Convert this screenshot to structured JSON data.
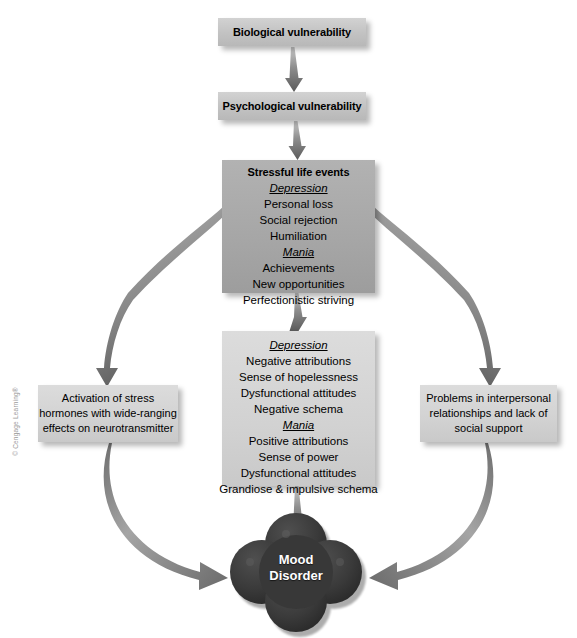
{
  "figure": {
    "background": "#ffffff",
    "copyright": "© Cengage Learning®"
  },
  "colors": {
    "box_top_fill": "#c5c5c5",
    "box_stressful_fill": "#a8a8a8",
    "box_cognitive_fill": "#d2d2d2",
    "box_side_fill": "#cfcfcf",
    "cloud_fill": "#3a3a3a",
    "arrow_fill": "#707070",
    "text": "#000000",
    "cloud_text": "#ffffff"
  },
  "nodes": {
    "biological": {
      "title": "Biological vulnerability"
    },
    "psychological": {
      "title": "Psychological vulnerability"
    },
    "stressful": {
      "title": "Stressful life events",
      "depression_label": "Depression",
      "depression_items": [
        "Personal loss",
        "Social rejection",
        "Humiliation"
      ],
      "mania_label": "Mania",
      "mania_items": [
        "Achievements",
        "New opportunities",
        "Perfectionistic striving"
      ]
    },
    "cognitive": {
      "depression_label": "Depression",
      "depression_items": [
        "Negative attributions",
        "Sense of hopelessness",
        "Dysfunctional attitudes",
        "Negative schema"
      ],
      "mania_label": "Mania",
      "mania_items": [
        "Positive attributions",
        "Sense of power",
        "Dysfunctional attitudes",
        "Grandiose & impulsive schema"
      ]
    },
    "stress_hormones": {
      "lines": [
        "Activation of stress",
        "hormones with wide-ranging",
        "effects on neurotransmitter"
      ]
    },
    "interpersonal": {
      "lines": [
        "Problems in interpersonal",
        "relationships and lack of",
        "social support"
      ]
    },
    "outcome": {
      "line1": "Mood",
      "line2": "Disorder"
    }
  },
  "connections": [
    {
      "from": "biological",
      "to": "psychological",
      "style": "straight-tapered-arrow"
    },
    {
      "from": "psychological",
      "to": "stressful",
      "style": "straight-tapered-arrow"
    },
    {
      "from": "stressful",
      "to": "stress_hormones",
      "style": "curved-tapered-arrow"
    },
    {
      "from": "stressful",
      "to": "interpersonal",
      "style": "curved-tapered-arrow"
    },
    {
      "from": "stressful",
      "to": "cognitive",
      "style": "straight-tapered-arrow"
    },
    {
      "from": "cognitive",
      "to": "outcome",
      "style": "straight-tapered-arrow"
    },
    {
      "from": "stress_hormones",
      "to": "outcome",
      "style": "curved-sweep-arrow"
    },
    {
      "from": "interpersonal",
      "to": "outcome",
      "style": "curved-sweep-arrow"
    }
  ]
}
